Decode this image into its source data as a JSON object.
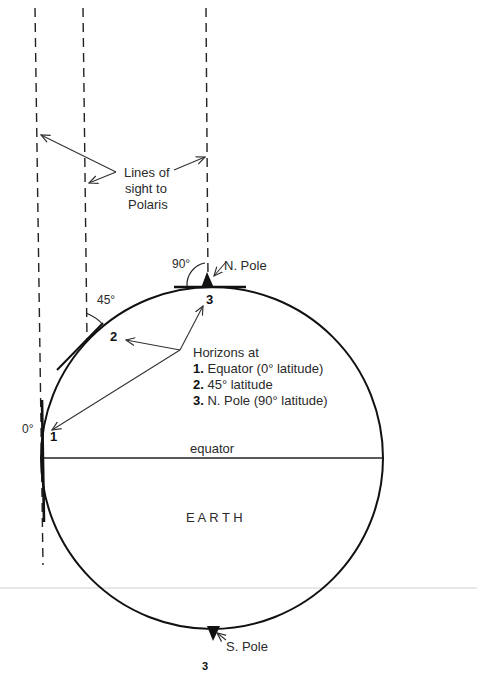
{
  "figure": {
    "lines_of_sight_label": [
      "Lines of",
      "sight to",
      "Polaris"
    ],
    "north_pole_label": "N. Pole",
    "south_pole_label": "S. Pole",
    "earth_label": "E A R T H",
    "equator_label": "equator",
    "angle_labels": {
      "equator": "0°",
      "mid_latitude": "45°",
      "pole": "90°"
    },
    "point_markers": {
      "p1": "1",
      "p2": "2",
      "p3": "3"
    },
    "legend": {
      "title": "Horizons at",
      "items": [
        {
          "num": "1.",
          "text": " Equator (0° latitude)"
        },
        {
          "num": "2.",
          "text": " 45° latitude"
        },
        {
          "num": "3.",
          "text": " N. Pole (90° latitude)"
        }
      ]
    },
    "page_number": "3"
  }
}
